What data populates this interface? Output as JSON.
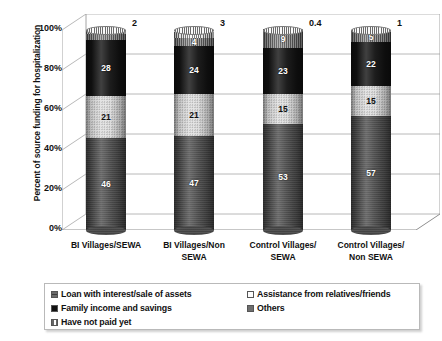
{
  "chart_data": {
    "type": "bar",
    "subtype": "stacked-100-percent-cylinder-3d",
    "title": "",
    "xlabel": "",
    "ylabel": "Percent of source funding for hospitalization",
    "ylim": [
      0,
      100
    ],
    "ytick_labels": [
      "100%",
      "80%",
      "60%",
      "40%",
      "20%",
      "0%"
    ],
    "ytick_values": [
      100,
      80,
      60,
      40,
      20,
      0
    ],
    "grid": true,
    "legend_position": "bottom",
    "categories": [
      "BI Villages/SEWA",
      "BI Villages/Non SEWA",
      "Control Villages/ SEWA",
      "Control Villages/ Non SEWA"
    ],
    "category_lines": [
      [
        "BI Villages/SEWA"
      ],
      [
        "BI Villages/Non",
        "SEWA"
      ],
      [
        "Control Villages/",
        "SEWA"
      ],
      [
        "Control Villages/",
        "Non SEWA"
      ]
    ],
    "series": [
      {
        "name": "Loan with interest/sale of assets",
        "color": "#4a4a4a",
        "values": [
          46,
          47,
          53,
          57
        ],
        "labels": [
          "46",
          "47",
          "53",
          "57"
        ]
      },
      {
        "name": "Assistance from relatives/friends",
        "color": "#e2e2e2",
        "values": [
          21,
          21,
          15,
          15
        ],
        "labels": [
          "21",
          "21",
          "15",
          "15"
        ]
      },
      {
        "name": "Family income and savings",
        "color": "#111111",
        "values": [
          28,
          24,
          23,
          22
        ],
        "labels": [
          "28",
          "24",
          "23",
          "22"
        ]
      },
      {
        "name": "Others",
        "color": "#6e6e6e",
        "values": [
          3,
          4,
          9,
          5
        ],
        "labels": [
          "3",
          "4",
          "9",
          "5"
        ]
      },
      {
        "name": "Have not paid yet",
        "color": "#c9c9c9",
        "values": [
          2,
          3,
          0.4,
          1
        ],
        "labels": [
          "2",
          "3",
          "0.4",
          "1"
        ]
      }
    ]
  },
  "legend": {
    "left_column": [
      {
        "label": "Loan with interest/sale of assets",
        "swatch": "#4a4a4a"
      },
      {
        "label": "Family income and savings",
        "swatch": "#111111"
      },
      {
        "label": "Have not paid yet",
        "swatch": "#d8d8d8"
      }
    ],
    "right_column": [
      {
        "label": "Assistance from relatives/friends",
        "swatch": "#fdfdfd"
      },
      {
        "label": "Others",
        "swatch": "#6e6e6e"
      }
    ]
  }
}
